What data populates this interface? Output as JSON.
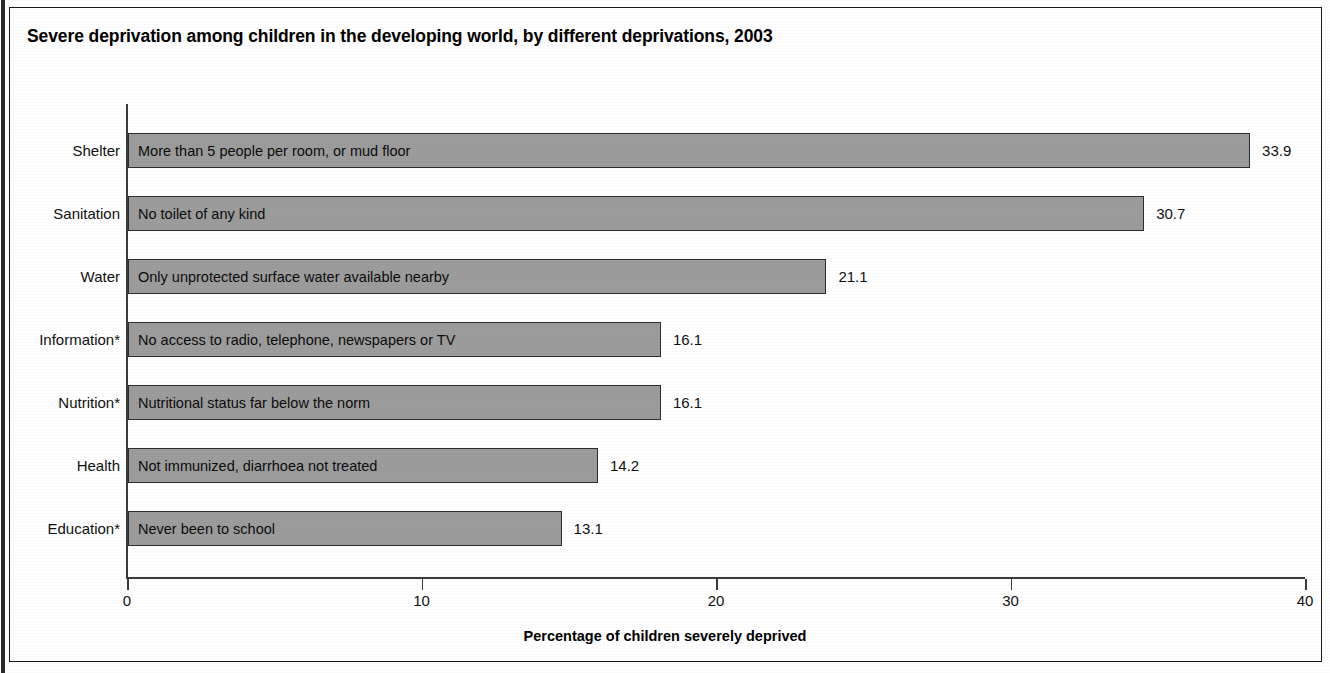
{
  "figure": {
    "title": "Severe deprivation among children in the developing world, by different deprivations, 2003"
  },
  "chart_data": {
    "type": "bar",
    "orientation": "horizontal",
    "title": "Severe deprivation among children in the developing world, by different deprivations, 2003",
    "xlabel": "Percentage of children severely deprived",
    "ylabel": "",
    "xlim": [
      0,
      40
    ],
    "xticks": [
      0,
      10,
      20,
      30,
      40
    ],
    "xtick_labels": [
      "0",
      "10",
      "20",
      "30",
      "40"
    ],
    "grid": false,
    "legend": null,
    "bar_color": "#9c9c9c",
    "bar_edge_color": "#2e2e2e",
    "categories": [
      "Shelter",
      "Sanitation",
      "Water",
      "Information*",
      "Nutrition*",
      "Health",
      "Education*"
    ],
    "values": [
      33.9,
      30.7,
      21.1,
      16.1,
      16.1,
      14.2,
      13.1
    ],
    "value_labels": [
      "33.9",
      "30.7",
      "21.1",
      "16.1",
      "16.1",
      "14.2",
      "13.1"
    ],
    "bar_descriptions": [
      "More than 5 people per room, or mud floor",
      "No toilet of any kind",
      "Only unprotected surface water available nearby",
      "No access to radio, telephone, newspapers or TV",
      "Nutritional status far below the norm",
      "Not immunized, diarrhoea not treated",
      "Never been to school"
    ],
    "bars": [
      {
        "category": "Shelter",
        "value": 33.9,
        "label": "33.9",
        "description": "More than 5 people per room, or mud floor"
      },
      {
        "category": "Sanitation",
        "value": 30.7,
        "label": "30.7",
        "description": "No toilet of any kind"
      },
      {
        "category": "Water",
        "value": 21.1,
        "label": "21.1",
        "description": "Only unprotected surface water available nearby"
      },
      {
        "category": "Information*",
        "value": 16.1,
        "label": "16.1",
        "description": "No access to radio, telephone, newspapers or TV"
      },
      {
        "category": "Nutrition*",
        "value": 16.1,
        "label": "16.1",
        "description": "Nutritional status far below the norm"
      },
      {
        "category": "Health",
        "value": 14.2,
        "label": "14.2",
        "description": "Not immunized, diarrhoea not treated"
      },
      {
        "category": "Education*",
        "value": 13.1,
        "label": "13.1",
        "description": "Never been to school"
      }
    ]
  },
  "geometry": {
    "plot_left_px": 128,
    "bar_pixels_per_unit": 33.1,
    "bar_row_tops": [
      133,
      196,
      259,
      322,
      385,
      448,
      511
    ],
    "bar_height_px": 35,
    "axis_zero_px": 127,
    "axis_pixels_per_unit": 29.45
  }
}
